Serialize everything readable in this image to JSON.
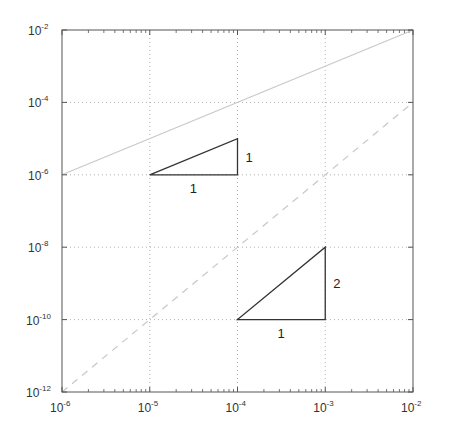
{
  "chart_data": {
    "type": "line",
    "title": "",
    "xlabel": "",
    "ylabel": "",
    "xscale": "log",
    "yscale": "log",
    "xlim": [
      1e-06,
      0.01
    ],
    "ylim": [
      1e-12,
      0.01
    ],
    "grid": true,
    "grid_style": "dotted",
    "legend": null,
    "x_ticks": [
      {
        "base": "10",
        "exp": "-6",
        "value": 1e-06
      },
      {
        "base": "10",
        "exp": "-5",
        "value": 1e-05
      },
      {
        "base": "10",
        "exp": "-4",
        "value": 0.0001
      },
      {
        "base": "10",
        "exp": "-3",
        "value": 0.001
      },
      {
        "base": "10",
        "exp": "-2",
        "value": 0.01
      }
    ],
    "y_ticks": [
      {
        "base": "10",
        "exp": "-2",
        "value": 0.01
      },
      {
        "base": "10",
        "exp": "-4",
        "value": 0.0001
      },
      {
        "base": "10",
        "exp": "-6",
        "value": 1e-06
      },
      {
        "base": "10",
        "exp": "-8",
        "value": 1e-08
      },
      {
        "base": "10",
        "exp": "-10",
        "value": 1e-10
      },
      {
        "base": "10",
        "exp": "-12",
        "value": 1e-12
      }
    ],
    "series": [
      {
        "name": "slope-1 reference (y = x)",
        "style": "solid",
        "color": "#c8c8c8",
        "x": [
          1e-06,
          0.01
        ],
        "y": [
          1e-06,
          0.01
        ]
      },
      {
        "name": "slope-2 reference (y = x^2)",
        "style": "dashed",
        "color": "#c8c8c8",
        "x": [
          1e-06,
          0.01
        ],
        "y": [
          1e-12,
          0.0001
        ]
      }
    ],
    "annotations": [
      {
        "type": "slope-triangle",
        "vertices": [
          [
            1e-05,
            1e-06
          ],
          [
            0.0001,
            1e-06
          ],
          [
            0.0001,
            1e-05
          ]
        ],
        "run_label": "1",
        "rise_label": "1"
      },
      {
        "type": "slope-triangle",
        "vertices": [
          [
            0.0001,
            1e-10
          ],
          [
            0.001,
            1e-10
          ],
          [
            0.001,
            1e-08
          ]
        ],
        "run_label": "1",
        "rise_label": "2"
      }
    ]
  },
  "colors": {
    "axis": "#555555",
    "grid": "#b0b0b0",
    "triangle": "#333333",
    "reference_line": "#c8c8c8"
  }
}
